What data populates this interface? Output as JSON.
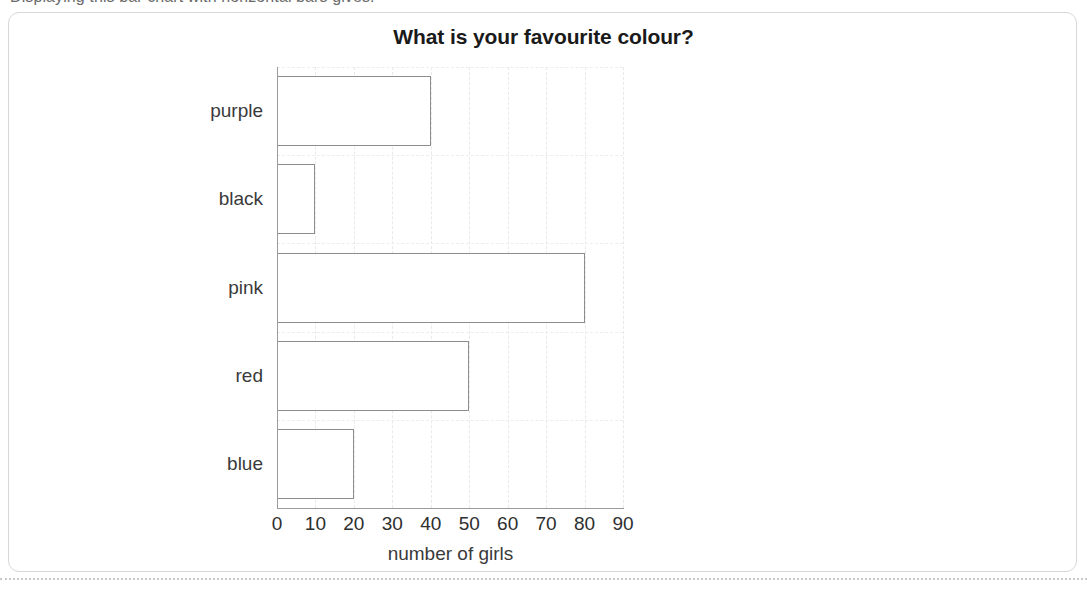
{
  "lead_text": "Displaying this bar chart with horizontal bars gives:",
  "card": {
    "border_color": "#d8d8d8",
    "background": "#ffffff"
  },
  "bottom_separator": {
    "style": "dotted",
    "color": "#c9c9c9"
  },
  "chart_data": {
    "type": "bar",
    "orientation": "horizontal",
    "title": "What is your favourite colour?",
    "xlabel": "number of girls",
    "ylabel": "",
    "categories": [
      "purple",
      "black",
      "pink",
      "red",
      "blue"
    ],
    "values": [
      40,
      10,
      80,
      50,
      20
    ],
    "xticks": [
      0,
      10,
      20,
      30,
      40,
      50,
      60,
      70,
      80,
      90
    ],
    "xlim": [
      0,
      90
    ],
    "grid": true,
    "legend": "none",
    "bar_fill": "#ffffff",
    "bar_stroke": "#8d8d8d",
    "axis_color": "#9a9a9a",
    "gridline_color": "#e9e9e9",
    "title_color": "#1a1a1a",
    "label_color": "#3a3a3a"
  }
}
